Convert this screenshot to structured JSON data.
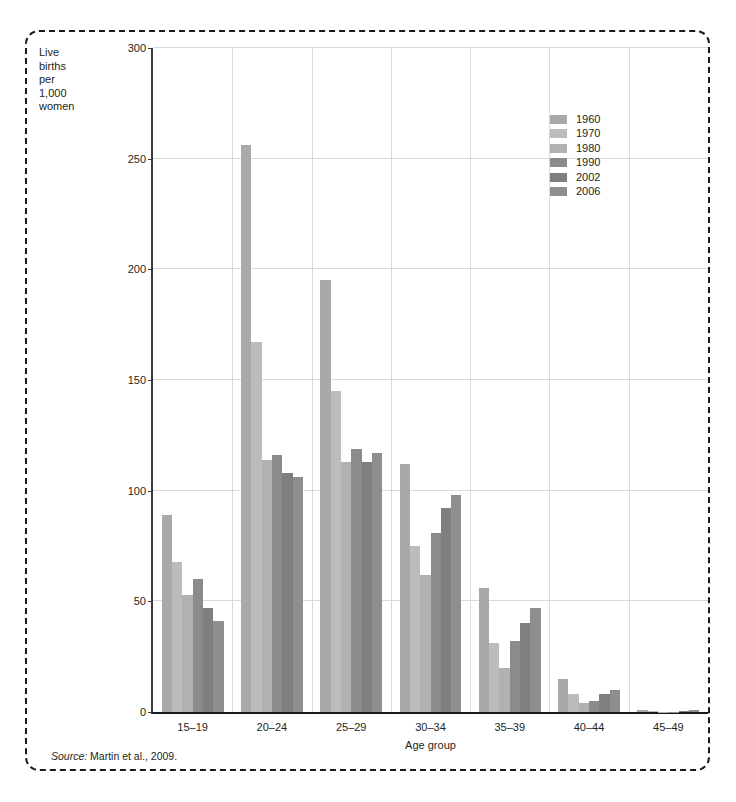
{
  "figure": {
    "y_axis_title": "Live births per 1,000 women",
    "y_axis_title_lines": [
      "Live",
      "births",
      "per",
      "1,000",
      "women"
    ],
    "source_prefix": "Source:",
    "source_text": " Martin et al., 2009."
  },
  "chart_data": {
    "type": "bar",
    "title": "",
    "xlabel": "Age group",
    "ylabel": "Live births per 1,000 women",
    "ylim": [
      0,
      300
    ],
    "yticks": [
      0,
      50,
      100,
      150,
      200,
      250,
      300
    ],
    "ytick_labels": [
      "0",
      "50",
      "100",
      "150",
      "200",
      "250",
      "300"
    ],
    "grid": "horizontal-and-vertical",
    "legend_position": "upper-right-inside",
    "categories": [
      "15–19",
      "20–24",
      "25–29",
      "30–34",
      "35–39",
      "40–44",
      "45–49"
    ],
    "series": [
      {
        "name": "1960",
        "color": "#a9a9a9",
        "values": [
          89,
          256,
          195,
          112,
          56,
          15,
          0.9
        ]
      },
      {
        "name": "1970",
        "color": "#bcbcbc",
        "values": [
          68,
          167,
          145,
          75,
          31,
          8,
          0.4
        ]
      },
      {
        "name": "1980",
        "color": "#b1b1b1",
        "values": [
          53,
          114,
          113,
          62,
          20,
          4,
          0.2
        ]
      },
      {
        "name": "1990",
        "color": "#8b8b8b",
        "values": [
          60,
          116,
          119,
          81,
          32,
          5,
          0.2
        ]
      },
      {
        "name": "2002",
        "color": "#7f7f7f",
        "values": [
          47,
          108,
          113,
          92,
          40,
          8,
          0.5
        ]
      },
      {
        "name": "2006",
        "color": "#8e8e8e",
        "values": [
          41,
          106,
          117,
          98,
          47,
          10,
          0.7
        ]
      }
    ]
  }
}
